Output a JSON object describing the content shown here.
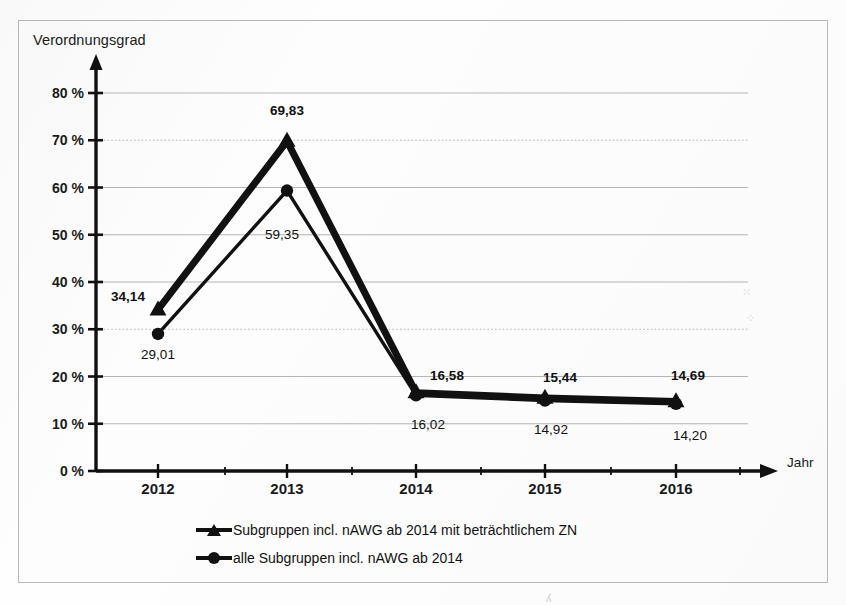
{
  "chart_data": {
    "type": "line",
    "title": "",
    "xlabel": "Jahr",
    "ylabel": "Verordnungsgrad",
    "categories": [
      "2012",
      "2013",
      "2014",
      "2015",
      "2016"
    ],
    "x": [
      2012,
      2013,
      2014,
      2015,
      2016
    ],
    "ylim": [
      0,
      80
    ],
    "ytick_values": [
      0,
      10,
      20,
      30,
      40,
      50,
      60,
      70,
      80
    ],
    "ytick_labels": [
      "0 %",
      "10 %",
      "20 %",
      "30 %",
      "40 %",
      "50 %",
      "60 %",
      "70 %",
      "80 %"
    ],
    "grid": true,
    "legend_position": "bottom",
    "series": [
      {
        "name": "Subgruppen incl. nAWG ab 2014 mit beträchtlichem ZN",
        "marker": "triangle",
        "values": [
          34.14,
          69.83,
          16.58,
          15.44,
          14.69
        ],
        "labels": [
          "34,14",
          "69,83",
          "16,58",
          "15,44",
          "14,69"
        ],
        "label_bold": true,
        "color": "#111111"
      },
      {
        "name": "alle Subgruppen incl. nAWG ab 2014",
        "marker": "circle",
        "values": [
          29.01,
          59.35,
          16.02,
          14.92,
          14.2
        ],
        "labels": [
          "29,01",
          "59,35",
          "16,02",
          "14,92",
          "14,20"
        ],
        "label_bold": false,
        "color": "#111111"
      }
    ]
  },
  "axes": {
    "y_title": "Verordnungsgrad",
    "x_title": "Jahr"
  },
  "legend": {
    "items": [
      {
        "label": "Subgruppen incl. nAWG ab 2014 mit beträchtlichem ZN",
        "marker": "triangle-marker"
      },
      {
        "label": "alle Subgruppen incl. nAWG ab 2014",
        "marker": "circle-marker"
      }
    ]
  },
  "colors": {
    "ink": "#111111",
    "grid": "#b5b5b5",
    "frame": "#b9b9b9",
    "paper": "#fdfdfd"
  }
}
